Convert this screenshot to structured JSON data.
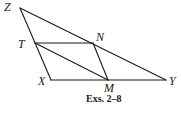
{
  "figure": {
    "caption": "Exs. 2–8",
    "points": {
      "Z": {
        "label": "Z",
        "x": 20,
        "y": 8
      },
      "T": {
        "label": "T",
        "x": 35,
        "y": 43
      },
      "X": {
        "label": "X",
        "x": 51,
        "y": 80
      },
      "N": {
        "label": "N",
        "x": 93,
        "y": 43
      },
      "M": {
        "label": "M",
        "x": 108,
        "y": 80
      },
      "Y": {
        "label": "Y",
        "x": 166,
        "y": 80
      }
    },
    "segments": [
      [
        "Z",
        "X"
      ],
      [
        "Z",
        "Y"
      ],
      [
        "X",
        "Y"
      ],
      [
        "T",
        "N"
      ],
      [
        "T",
        "M"
      ],
      [
        "N",
        "M"
      ]
    ],
    "line_color": "#1a1a1a"
  }
}
